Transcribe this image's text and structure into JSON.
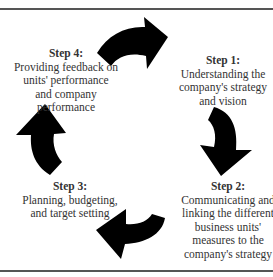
{
  "diagram": {
    "type": "cycle",
    "direction": "clockwise",
    "steps": [
      {
        "id": "step1",
        "title": "Step 1:",
        "description": "Understanding the\ncompany's strategy\nand vision"
      },
      {
        "id": "step2",
        "title": "Step 2:",
        "description": "Communicating and\nlinking the different\nbusiness units'\nmeasures to the\ncompany's strategy"
      },
      {
        "id": "step3",
        "title": "Step 3:",
        "description": "Planning, budgeting,\nand target setting"
      },
      {
        "id": "step4",
        "title": "Step 4:",
        "description": "Providing feedback on\nunits' performance\nand company\nperformance"
      }
    ],
    "arrows": [
      {
        "from": "step4",
        "to": "step1",
        "position": "top"
      },
      {
        "from": "step1",
        "to": "step2",
        "position": "right"
      },
      {
        "from": "step2",
        "to": "step3",
        "position": "bottom"
      },
      {
        "from": "step3",
        "to": "step4",
        "position": "left"
      }
    ],
    "colors": {
      "arrow": "#000000",
      "rule": "#555555",
      "text": "#333333",
      "background": "#ffffff"
    }
  }
}
